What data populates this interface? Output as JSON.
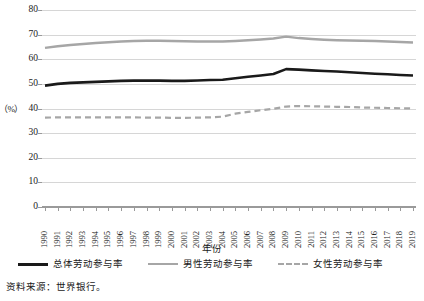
{
  "chart_data": {
    "type": "line",
    "title": "",
    "xlabel": "年份",
    "ylabel": "（%）",
    "ylim": [
      0,
      80
    ],
    "yticks": [
      0,
      10,
      20,
      30,
      40,
      50,
      60,
      70,
      80
    ],
    "grid": true,
    "legend_position": "bottom",
    "categories": [
      "1990",
      "1991",
      "1992",
      "1993",
      "1994",
      "1995",
      "1996",
      "1997",
      "1998",
      "1999",
      "2000",
      "2001",
      "2002",
      "2003",
      "2004",
      "2005",
      "2006",
      "2007",
      "2008",
      "2009",
      "2010",
      "2011",
      "2012",
      "2013",
      "2014",
      "2015",
      "2016",
      "2017",
      "2018",
      "2019"
    ],
    "series": [
      {
        "name": "总体劳动参与率",
        "style": "solid",
        "color": "#1a1a1a",
        "width": 2.6,
        "values": [
          49.3,
          50.0,
          50.4,
          50.6,
          50.8,
          51.0,
          51.2,
          51.3,
          51.3,
          51.3,
          51.2,
          51.2,
          51.4,
          51.6,
          51.7,
          52.3,
          52.9,
          53.4,
          54.0,
          56.0,
          55.8,
          55.5,
          55.2,
          55.0,
          54.7,
          54.4,
          54.1,
          53.9,
          53.6,
          53.4
        ]
      },
      {
        "name": "男性劳动参与率",
        "style": "solid",
        "color": "#a6a6a6",
        "width": 2.4,
        "values": [
          64.6,
          65.3,
          65.8,
          66.2,
          66.6,
          66.9,
          67.2,
          67.4,
          67.5,
          67.5,
          67.4,
          67.3,
          67.2,
          67.2,
          67.2,
          67.4,
          67.7,
          68.0,
          68.4,
          69.2,
          68.6,
          68.2,
          67.9,
          67.7,
          67.6,
          67.5,
          67.4,
          67.2,
          67.0,
          66.8
        ]
      },
      {
        "name": "女性劳动参与率",
        "style": "dashed",
        "color": "#a6a6a6",
        "width": 2.2,
        "values": [
          36.3,
          36.4,
          36.4,
          36.4,
          36.4,
          36.4,
          36.4,
          36.4,
          36.3,
          36.3,
          36.2,
          36.2,
          36.3,
          36.4,
          36.7,
          37.9,
          38.6,
          39.3,
          39.9,
          40.8,
          41.0,
          40.9,
          40.8,
          40.7,
          40.6,
          40.4,
          40.3,
          40.2,
          40.1,
          40.0
        ]
      }
    ]
  },
  "legend": {
    "items": [
      {
        "label": "总体劳动参与率"
      },
      {
        "label": "男性劳动参与率"
      },
      {
        "label": "女性劳动参与率"
      }
    ]
  },
  "source": {
    "text": "资料来源：世界银行。"
  }
}
